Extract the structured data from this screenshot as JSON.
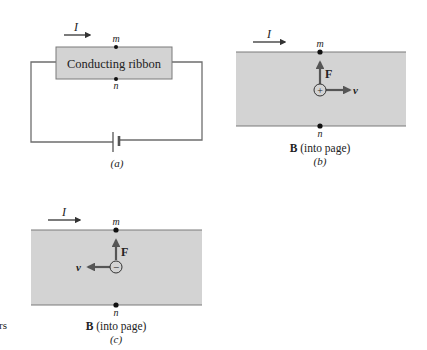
{
  "colors": {
    "ribbon_fill": "#d3d3d3",
    "ribbon_edge": "#7a7a7a",
    "wire": "#6e6e6e",
    "arrow": "#555555",
    "text": "#222222",
    "background": "#ffffff"
  },
  "panel_a": {
    "current_label": "I",
    "ribbon_label": "Conducting ribbon",
    "top_point": "m",
    "bottom_point": "n",
    "caption": "(a)",
    "components": [
      "conducting-ribbon",
      "wire-loop",
      "battery"
    ]
  },
  "panel_b": {
    "current_label": "I",
    "top_point": "m",
    "bottom_point": "n",
    "force_label": "F",
    "velocity_label": "v",
    "charge_sign": "+",
    "velocity_direction": "right",
    "force_direction": "up",
    "field_label_bold": "B",
    "field_label_rest": " (into page)",
    "caption": "(b)"
  },
  "panel_c": {
    "current_label": "I",
    "top_point": "m",
    "bottom_point": "n",
    "force_label": "F",
    "velocity_label": "v",
    "charge_sign": "−",
    "velocity_direction": "left",
    "force_direction": "up",
    "field_label_bold": "B",
    "field_label_rest": " (into page)",
    "caption": "(c)"
  },
  "margin_fragment": "rs"
}
